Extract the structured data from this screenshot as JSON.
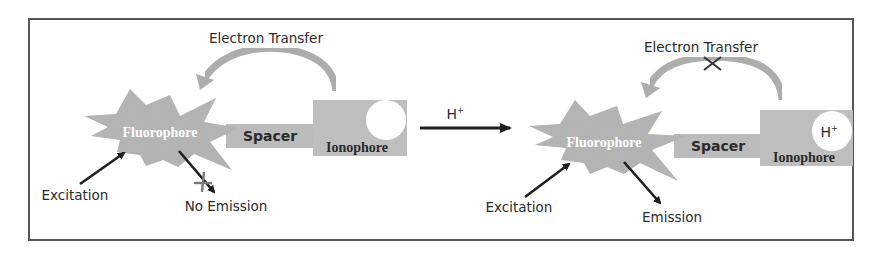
{
  "diagram": {
    "colors": {
      "component_fill": "#b9b9b9",
      "starburst_fill": "#b0b0b0",
      "curved_arrow": "#a8a8a8",
      "arrow": "#1e1e1e",
      "cross_mark_left": "#7a7a7a",
      "cross_mark_right": "#333333",
      "frame": "#555555",
      "background": "#ffffff"
    },
    "left_state": {
      "fluorophore_label": "Fluorophore",
      "spacer_label": "Spacer",
      "ionophore_label": "Ionophore",
      "receptor_content": "",
      "electron_transfer_label": "Electron Transfer",
      "electron_transfer_blocked": false,
      "excitation_label": "Excitation",
      "emission_label": "No Emission",
      "emission_blocked": true
    },
    "transition": {
      "label": "H",
      "label_superscript": "+"
    },
    "right_state": {
      "fluorophore_label": "Fluorophore",
      "spacer_label": "Spacer",
      "ionophore_label": "Ionophore",
      "receptor_content": "H",
      "receptor_superscript": "+",
      "electron_transfer_label": "Electron Transfer",
      "electron_transfer_blocked": true,
      "excitation_label": "Excitation",
      "emission_label": "Emission",
      "emission_blocked": false
    }
  }
}
